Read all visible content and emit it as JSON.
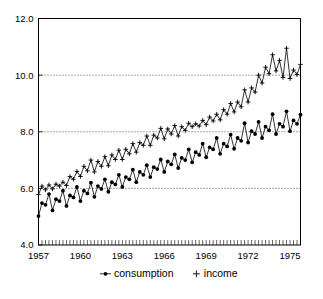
{
  "chart_data": {
    "type": "line",
    "title": "",
    "subtitle": "",
    "xlabel": "",
    "ylabel": "",
    "xlim": [
      1957.0,
      1975.75
    ],
    "ylim": [
      4.0,
      12.0
    ],
    "grid": true,
    "gridlines_y": [
      6.0,
      8.0,
      10.0
    ],
    "legend_position": "bottom",
    "y_ticks": [
      "4.0",
      "6.0",
      "8.0",
      "10.0",
      "12.0"
    ],
    "y_tick_values": [
      4.0,
      6.0,
      8.0,
      10.0,
      12.0
    ],
    "x_ticks": [
      "1957",
      "1960",
      "1963",
      "1966",
      "1969",
      "1972",
      "1975"
    ],
    "x_tick_values": [
      1957,
      1960,
      1963,
      1966,
      1969,
      1972,
      1975
    ],
    "x_minor_tick_interval": 0.25,
    "x": [
      1957.0,
      1957.25,
      1957.5,
      1957.75,
      1958.0,
      1958.25,
      1958.5,
      1958.75,
      1959.0,
      1959.25,
      1959.5,
      1959.75,
      1960.0,
      1960.25,
      1960.5,
      1960.75,
      1961.0,
      1961.25,
      1961.5,
      1961.75,
      1962.0,
      1962.25,
      1962.5,
      1962.75,
      1963.0,
      1963.25,
      1963.5,
      1963.75,
      1964.0,
      1964.25,
      1964.5,
      1964.75,
      1965.0,
      1965.25,
      1965.5,
      1965.75,
      1966.0,
      1966.25,
      1966.5,
      1966.75,
      1967.0,
      1967.25,
      1967.5,
      1967.75,
      1968.0,
      1968.25,
      1968.5,
      1968.75,
      1969.0,
      1969.25,
      1969.5,
      1969.75,
      1970.0,
      1970.25,
      1970.5,
      1970.75,
      1971.0,
      1971.25,
      1971.5,
      1971.75,
      1972.0,
      1972.25,
      1972.5,
      1972.75,
      1973.0,
      1973.25,
      1973.5,
      1973.75,
      1974.0,
      1974.25,
      1974.5,
      1974.75,
      1975.0,
      1975.25,
      1975.5,
      1975.75
    ],
    "series": [
      {
        "name": "consumption",
        "marker": "filled-circle",
        "values": [
          5.02,
          5.48,
          5.42,
          5.8,
          5.22,
          5.62,
          5.55,
          5.92,
          5.38,
          5.75,
          5.68,
          6.05,
          5.55,
          5.92,
          5.82,
          6.2,
          5.7,
          6.08,
          5.98,
          6.32,
          5.88,
          6.22,
          6.14,
          6.48,
          6.05,
          6.4,
          6.32,
          6.66,
          6.22,
          6.58,
          6.48,
          6.82,
          6.4,
          6.75,
          6.68,
          7.02,
          6.58,
          6.95,
          6.85,
          7.2,
          6.72,
          7.08,
          7.0,
          7.38,
          6.92,
          7.28,
          7.18,
          7.58,
          7.1,
          7.45,
          7.38,
          7.78,
          7.22,
          7.58,
          7.48,
          7.9,
          7.4,
          7.78,
          7.68,
          8.3,
          7.62,
          8.02,
          7.92,
          8.35,
          7.78,
          8.18,
          8.05,
          8.62,
          7.92,
          8.28,
          8.18,
          8.72,
          8.02,
          8.4,
          8.28,
          8.6
        ]
      },
      {
        "name": "income",
        "marker": "plus",
        "values": [
          5.78,
          6.08,
          5.95,
          6.12,
          5.98,
          6.15,
          6.08,
          6.22,
          6.1,
          6.42,
          6.32,
          6.6,
          6.42,
          6.78,
          6.62,
          7.0,
          6.58,
          6.95,
          6.78,
          7.12,
          6.8,
          7.18,
          7.02,
          7.35,
          7.02,
          7.38,
          7.22,
          7.58,
          7.28,
          7.62,
          7.52,
          7.85,
          7.52,
          7.88,
          7.78,
          8.12,
          7.75,
          8.1,
          7.92,
          8.22,
          7.85,
          8.18,
          8.05,
          8.3,
          8.18,
          8.28,
          8.2,
          8.4,
          8.25,
          8.52,
          8.38,
          8.62,
          8.42,
          8.78,
          8.62,
          9.0,
          8.7,
          9.05,
          8.88,
          9.48,
          9.05,
          9.55,
          9.4,
          10.0,
          9.72,
          10.28,
          10.05,
          10.72,
          10.15,
          10.52,
          9.92,
          10.95,
          9.88,
          10.18,
          10.02,
          10.38
        ]
      }
    ]
  },
  "legend": {
    "items": [
      {
        "label": "consumption",
        "marker": "line-with-dot"
      },
      {
        "label": "income",
        "marker": "plus"
      }
    ]
  }
}
